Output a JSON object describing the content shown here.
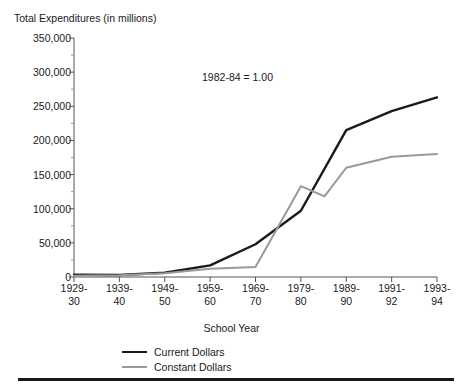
{
  "chart_data": {
    "type": "line",
    "title": "Total Expenditures (in millions)",
    "xlabel": "School Year",
    "ylabel": "Total Expenditures (in millions)",
    "annotation": "1982-84 = 1.00",
    "categories": [
      "1929-\n30",
      "1939-\n40",
      "1949-\n50",
      "1959-\n60",
      "1969-\n70",
      "1979-\n80",
      "1989-\n90",
      "1991-\n92",
      "1993-\n94"
    ],
    "category_lines": [
      [
        "1929-",
        "30"
      ],
      [
        "1939-",
        "40"
      ],
      [
        "1949-",
        "50"
      ],
      [
        "1959-",
        "60"
      ],
      [
        "1969-",
        "70"
      ],
      [
        "1979-",
        "80"
      ],
      [
        "1989-",
        "90"
      ],
      [
        "1991-",
        "92"
      ],
      [
        "1993-",
        "94"
      ]
    ],
    "ylim": [
      0,
      350000
    ],
    "ytick_values": [
      0,
      50000,
      100000,
      150000,
      200000,
      250000,
      300000,
      350000
    ],
    "ytick_labels": [
      "0",
      "50,000",
      "100,000",
      "150,000",
      "200,000",
      "250,000",
      "300,000",
      "350,000"
    ],
    "yminor_step": 25000,
    "grid": false,
    "legend_position": "bottom-left",
    "series": [
      {
        "name": "Current Dollars",
        "color": "#1a1a1a",
        "values": [
          3200,
          3000,
          6200,
          17000,
          48000,
          97000,
          215000,
          243000,
          263000
        ]
      },
      {
        "name": "Constant Dollars",
        "color": "#999999",
        "values": [
          2000,
          2500,
          5500,
          12000,
          14500,
          133000,
          160000,
          176000,
          180000
        ],
        "extra_vertices": [
          {
            "x_fraction": 0.69,
            "value": 118000
          }
        ]
      }
    ]
  },
  "legend": {
    "items": [
      {
        "label": "Current Dollars"
      },
      {
        "label": "Constant Dollars"
      }
    ]
  }
}
